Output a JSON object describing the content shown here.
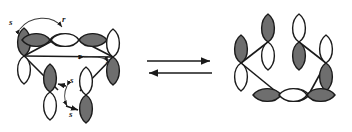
{
  "figure": {
    "title": "",
    "type": "chemistry-orbital-diagram",
    "background_color": "#ffffff",
    "line_color": "#1a1a1a",
    "lobe_shaded_color": "#6e6e6e",
    "lobe_empty_color": "#ffffff"
  },
  "left_structure": {
    "name": "open-orbital-array",
    "orbital_count": 6,
    "orbitals": [
      {
        "id": "p1",
        "label": "orbital-1",
        "cx": 24,
        "cy": 56,
        "angle": 0,
        "shaded_lobe": "top"
      },
      {
        "id": "p2",
        "label": "orbital-2",
        "cx": 50,
        "cy": 40,
        "angle": 90,
        "shaded_lobe": "right"
      },
      {
        "id": "p3",
        "label": "orbital-3",
        "cx": 79,
        "cy": 40,
        "angle": 90,
        "shaded_lobe": "left"
      },
      {
        "id": "p4",
        "label": "orbital-4",
        "cx": 113,
        "cy": 57,
        "angle": 0,
        "shaded_lobe": "bottom"
      },
      {
        "id": "p5",
        "label": "orbital-5",
        "cx": 50,
        "cy": 92,
        "angle": 0,
        "shaded_lobe": "top"
      },
      {
        "id": "p6",
        "label": "orbital-6",
        "cx": 86,
        "cy": 95,
        "angle": 0,
        "shaded_lobe": "bottom"
      }
    ],
    "bond_labels": [
      {
        "id": "lbl-s-top-left",
        "text": "s",
        "x": 9,
        "y": 25
      },
      {
        "id": "lbl-r-top-right",
        "text": "r",
        "x": 62,
        "y": 22
      },
      {
        "id": "lbl-r-mid",
        "text": "r",
        "x": 78,
        "y": 59
      },
      {
        "id": "lbl-s-mid-right",
        "text": "s",
        "x": 106,
        "y": 63
      },
      {
        "id": "lbl-s-bottom-up",
        "text": "s",
        "x": 69,
        "y": 82
      },
      {
        "id": "lbl-s-bottom-down",
        "text": "s",
        "x": 68,
        "y": 116
      }
    ]
  },
  "reaction_arrow": {
    "name": "equilibrium-arrow",
    "forward_label": "",
    "reverse_label": "",
    "x_start": 147,
    "x_end": 212,
    "y_top": 61,
    "y_bottom": 73
  },
  "right_structure": {
    "name": "cyclic-orbital-array",
    "orbital_count": 6,
    "orbitals": [
      {
        "id": "q1",
        "label": "orbital-1",
        "cx": 241,
        "cy": 63,
        "angle": 0,
        "shaded_lobe": "top"
      },
      {
        "id": "q2",
        "label": "orbital-2",
        "cx": 268,
        "cy": 42,
        "angle": 0,
        "shaded_lobe": "top"
      },
      {
        "id": "q3",
        "label": "orbital-3",
        "cx": 299,
        "cy": 42,
        "angle": 0,
        "shaded_lobe": "bottom"
      },
      {
        "id": "q4",
        "label": "orbital-4",
        "cx": 326,
        "cy": 63,
        "angle": 0,
        "shaded_lobe": "bottom"
      },
      {
        "id": "q5",
        "label": "orbital-5",
        "cx": 281,
        "cy": 95,
        "angle": 90,
        "shaded_lobe": "right"
      },
      {
        "id": "q6",
        "label": "orbital-6",
        "cx": 307,
        "cy": 95,
        "angle": 90,
        "shaded_lobe": "left"
      }
    ]
  }
}
